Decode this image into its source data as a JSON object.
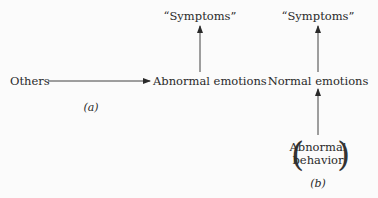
{
  "diagram_a": {
    "source_label": "Others",
    "middle_label": "Abnormal emotions",
    "top_label": "“Symptoms”",
    "caption": "(a)"
  },
  "diagram_b": {
    "top_label": "“Symptoms”",
    "middle_label": "Normal emotions",
    "bottom_label_line1": "Abnormal",
    "bottom_label_line2": "behavior",
    "caption": "(b)"
  },
  "colors": {
    "ink": "#2a2a2a",
    "background": "#fbfbfb"
  }
}
